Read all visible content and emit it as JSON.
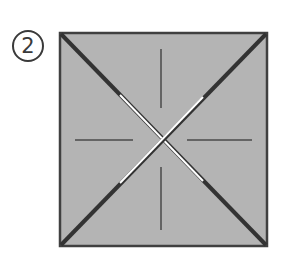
{
  "step": {
    "number": "2"
  },
  "diagram": {
    "type": "origami-fold-step",
    "colors": {
      "paper_fill": "#b4b4b4",
      "edge": "#404040",
      "crease": "#4a4a4a",
      "fold_highlight": "#ffffff"
    }
  }
}
